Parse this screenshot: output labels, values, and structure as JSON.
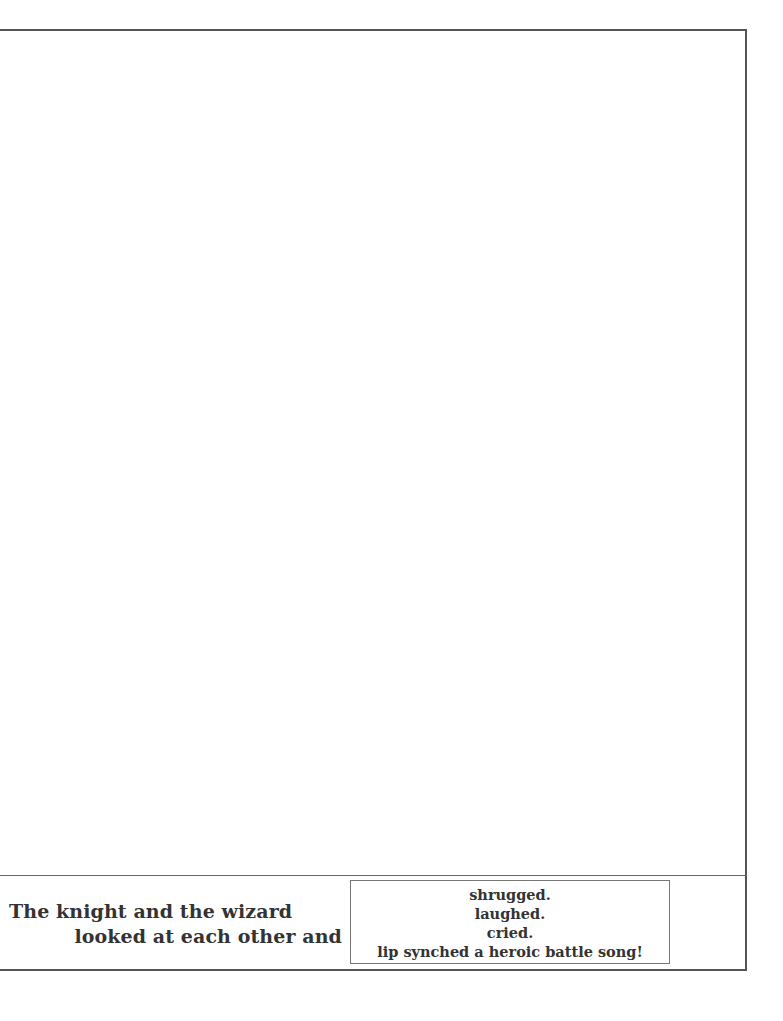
{
  "story": {
    "prompt_line_1": "The knight and the wizard",
    "prompt_line_2": "looked at each other and",
    "choices": [
      {
        "label": "shrugged."
      },
      {
        "label": "laughed."
      },
      {
        "label": "cried."
      },
      {
        "label": "lip synched a heroic battle song!"
      }
    ]
  },
  "colors": {
    "border": "#555555",
    "text": "#333333",
    "background": "#ffffff"
  }
}
